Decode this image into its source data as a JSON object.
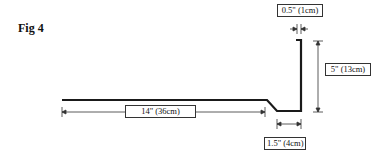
{
  "figure": {
    "label": "Fig 4"
  },
  "dimensions": {
    "thickness": "0.5\" (1cm)",
    "height": "5\" (13cm)",
    "length": "14\" (36cm)",
    "base": "1.5\" (4cm)"
  },
  "colors": {
    "line": "#1a1a1a",
    "background": "#ffffff"
  }
}
